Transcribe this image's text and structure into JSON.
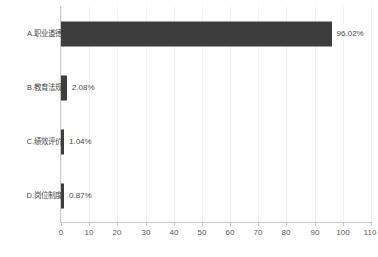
{
  "chart_data": {
    "type": "bar",
    "orientation": "horizontal",
    "title": "",
    "subtitle": "",
    "xlabel": "",
    "ylabel": "",
    "xlim": [
      0,
      110
    ],
    "ylim": null,
    "grid": true,
    "legend": false,
    "legend_position": "none",
    "categories": [
      "A.职业道德",
      "B.教育法规",
      "C.绩效评价",
      "D.岗位制度"
    ],
    "values": [
      96.02,
      2.08,
      1.04,
      0.87
    ],
    "value_labels": [
      "96.02%",
      "2.08%",
      "1.04%",
      "0.87%"
    ],
    "xticks": [
      0,
      10,
      20,
      30,
      40,
      50,
      60,
      70,
      80,
      90,
      100,
      110
    ],
    "xtick_labels": [
      "0",
      "10",
      "20",
      "30",
      "40",
      "50",
      "60",
      "70",
      "80",
      "90",
      "100",
      "110"
    ],
    "series": [
      {
        "name": "percent",
        "values": [
          96.02,
          2.08,
          1.04,
          0.87
        ]
      }
    ],
    "colors": {
      "bar": "#3d3d3d",
      "grid": "#f2f2f2",
      "axis": "#c9c9c9",
      "text": "#4a4a4a",
      "background": "#ffffff"
    }
  }
}
